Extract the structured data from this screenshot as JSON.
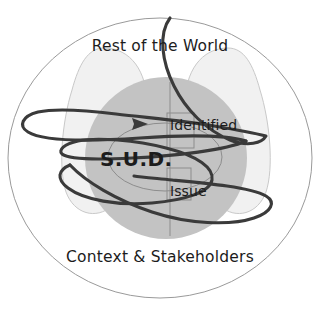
{
  "diagram": {
    "labels": {
      "rest_of_world": "Rest of the World",
      "context_stakeholders": "Context & Stakeholders",
      "sud": "S.U.D.",
      "identified": "Identified",
      "issue": "Issue"
    },
    "colors": {
      "background": "#ffffff",
      "outer_boundary_stroke": "#9a9a9a",
      "lobe_fill": "#f1f1f1",
      "lobe_stroke": "#c9c9c9",
      "sud_circle_fill": "#c3c3c3",
      "thin_line_stroke": "#8d8d8d",
      "scribble_stroke": "#3a3a3a",
      "text": "#1c1c1c"
    },
    "shapes": {
      "outer_ellipse": {
        "cx": 160,
        "cy": 158,
        "rx": 152,
        "ry": 140
      },
      "sud_circle": {
        "cx": 166,
        "cy": 158,
        "r": 81
      },
      "left_lobe": {
        "cx": 104,
        "cy": 116,
        "rx": 42,
        "ry": 68
      },
      "right_lobe": {
        "cx": 228,
        "cy": 116,
        "rx": 42,
        "ry": 68
      },
      "identified_box": {
        "x": 167,
        "y": 113,
        "width": 27,
        "height": 35
      },
      "issue_box": {
        "x": 167,
        "y": 168,
        "width": 24,
        "height": 32
      },
      "vertical_divider": {
        "x": 170,
        "y1": 82,
        "y2": 236
      }
    },
    "annotation": {
      "arrow_tip": {
        "x": 147,
        "y": 124
      },
      "arrow_direction": "right"
    }
  }
}
